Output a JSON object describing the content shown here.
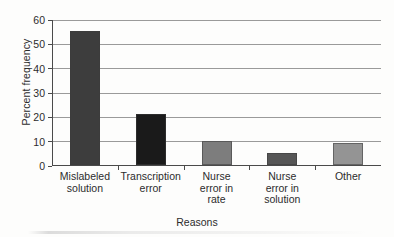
{
  "chart_data": {
    "type": "bar",
    "title": "",
    "xlabel": "Reasons",
    "ylabel": "Percent frequency",
    "categories": [
      "Mislabeled\nsolution",
      "Transcription\nerror",
      "Nurse\nerror in\nrate",
      "Nurse\nerror in\nsolution",
      "Other"
    ],
    "values": [
      55,
      21,
      10,
      5,
      9
    ],
    "ylim": [
      0,
      60
    ],
    "yticks": [
      0,
      10,
      20,
      30,
      40,
      50,
      60
    ],
    "ytick_labels": [
      "0",
      "10",
      "20",
      "30",
      "40",
      "50",
      "60"
    ],
    "grid": "horizontal",
    "legend": "none",
    "bar_colors": [
      "#3d3d3d",
      "#1a1a1a",
      "#7d7d7d",
      "#565656",
      "#949494"
    ]
  },
  "figure": {
    "background_color": "#fdfdfc",
    "axis_color": "#4a4a4a",
    "gridline_color": "#9a9a9a",
    "text_color": "#2c2c2c"
  }
}
